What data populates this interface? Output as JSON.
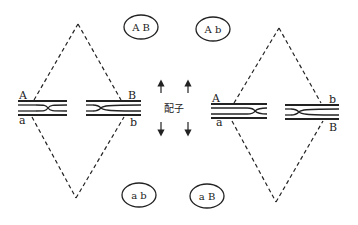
{
  "diagram": {
    "type": "genetics-crossover-gametes",
    "center_label": "配子",
    "colors": {
      "line": "#222222",
      "background": "#ffffff"
    },
    "left_pair": {
      "chromosome_labels": {
        "top_left": "A",
        "bottom_left": "a",
        "top_right": "B",
        "bottom_right": "b"
      }
    },
    "right_pair": {
      "chromosome_labels": {
        "top_left": "A",
        "bottom_left": "a",
        "top_right": "b",
        "bottom_right": "B"
      }
    },
    "gametes": [
      {
        "position": "top-left",
        "label": "A B"
      },
      {
        "position": "top-right",
        "label": "A b"
      },
      {
        "position": "bottom-left",
        "label": "a b"
      },
      {
        "position": "bottom-right",
        "label": "a B"
      }
    ],
    "arrows": [
      {
        "direction": "up",
        "position": "left"
      },
      {
        "direction": "up",
        "position": "right"
      },
      {
        "direction": "down",
        "position": "left"
      },
      {
        "direction": "down",
        "position": "right"
      }
    ]
  }
}
